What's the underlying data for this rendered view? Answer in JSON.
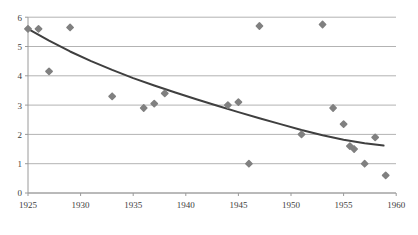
{
  "chart_data": {
    "type": "scatter",
    "title": "",
    "subtitle": "",
    "xlabel": "",
    "ylabel": "",
    "xlim": [
      1925,
      1960
    ],
    "ylim": [
      0,
      6
    ],
    "grid": true,
    "grid_axis": "y",
    "legend": false,
    "legend_position": "none",
    "x_ticks": [
      1925,
      1930,
      1935,
      1940,
      1945,
      1950,
      1955,
      1960
    ],
    "x_tick_labels": [
      "1925",
      "1930",
      "1935",
      "1940",
      "1945",
      "1950",
      "1955",
      "1960"
    ],
    "y_ticks": [
      0,
      1,
      2,
      3,
      4,
      5,
      6
    ],
    "y_tick_labels": [
      "0",
      "1",
      "2",
      "3",
      "4",
      "5",
      "6"
    ],
    "marker": "diamond",
    "marker_color": "#808080",
    "marker_size": 5,
    "series": [
      {
        "name": "observations",
        "type": "scatter",
        "points": [
          {
            "x": 1925,
            "y": 5.6
          },
          {
            "x": 1926,
            "y": 5.6
          },
          {
            "x": 1927,
            "y": 4.15
          },
          {
            "x": 1929,
            "y": 5.65
          },
          {
            "x": 1933,
            "y": 3.3
          },
          {
            "x": 1936,
            "y": 2.9
          },
          {
            "x": 1937,
            "y": 3.05
          },
          {
            "x": 1938,
            "y": 3.4
          },
          {
            "x": 1944,
            "y": 3.0
          },
          {
            "x": 1945,
            "y": 3.1
          },
          {
            "x": 1946,
            "y": 1.0
          },
          {
            "x": 1947,
            "y": 5.7
          },
          {
            "x": 1951,
            "y": 2.0
          },
          {
            "x": 1953,
            "y": 5.75
          },
          {
            "x": 1954,
            "y": 2.9
          },
          {
            "x": 1955,
            "y": 2.35
          },
          {
            "x": 1955.6,
            "y": 1.6
          },
          {
            "x": 1956,
            "y": 1.5
          },
          {
            "x": 1957,
            "y": 1.0
          },
          {
            "x": 1958,
            "y": 1.9
          },
          {
            "x": 1959,
            "y": 0.6
          }
        ]
      },
      {
        "name": "trend-curve",
        "type": "line",
        "color": "#3f3f3f",
        "width": 2,
        "points": [
          {
            "x": 1925.0,
            "y": 5.6
          },
          {
            "x": 1927.0,
            "y": 5.2
          },
          {
            "x": 1929.0,
            "y": 4.83
          },
          {
            "x": 1931.0,
            "y": 4.5
          },
          {
            "x": 1933.0,
            "y": 4.2
          },
          {
            "x": 1935.0,
            "y": 3.92
          },
          {
            "x": 1937.0,
            "y": 3.67
          },
          {
            "x": 1939.0,
            "y": 3.43
          },
          {
            "x": 1941.0,
            "y": 3.2
          },
          {
            "x": 1943.0,
            "y": 2.98
          },
          {
            "x": 1945.0,
            "y": 2.76
          },
          {
            "x": 1947.0,
            "y": 2.55
          },
          {
            "x": 1949.0,
            "y": 2.35
          },
          {
            "x": 1951.0,
            "y": 2.15
          },
          {
            "x": 1953.0,
            "y": 1.97
          },
          {
            "x": 1955.0,
            "y": 1.82
          },
          {
            "x": 1957.0,
            "y": 1.7
          },
          {
            "x": 1958.8,
            "y": 1.62
          }
        ]
      }
    ],
    "colors": {
      "marker": "#7f7f7f",
      "trend_line": "#3f3f3f",
      "gridline": "#b3b3b3",
      "axis": "#9a9a9a",
      "tick_text": "#3d3d3d",
      "background": "#ffffff"
    }
  }
}
